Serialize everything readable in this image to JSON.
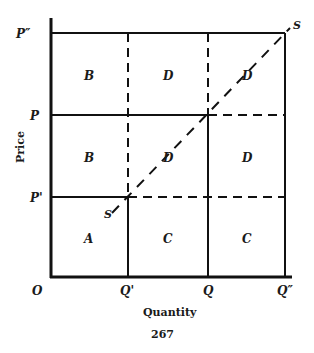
{
  "diagram": {
    "type": "supply-step-grid",
    "axes": {
      "origin_label": "O",
      "x_axis_label": "Quantity",
      "y_axis_label": "Price",
      "x_ticks": [
        "Q'",
        "Q",
        "Q″"
      ],
      "y_ticks": [
        "P″",
        "P",
        "P'"
      ]
    },
    "supply_curve_label": "S",
    "supply_curve_label_end": "S",
    "regions": {
      "row_top": [
        "B",
        "D",
        "D"
      ],
      "row_middle": [
        "B",
        "D",
        "D"
      ],
      "row_bottom": [
        "A",
        "C",
        "C"
      ]
    },
    "page_number": "267"
  }
}
